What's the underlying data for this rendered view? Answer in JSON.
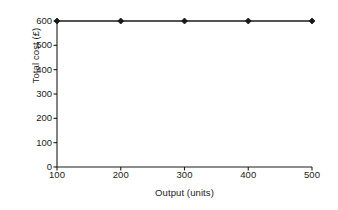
{
  "chart_data": {
    "type": "line",
    "title": "",
    "xlabel": "Output (units)",
    "ylabel": "Total cost (£)",
    "x": [
      100,
      200,
      300,
      400,
      500
    ],
    "values": [
      600,
      600,
      600,
      600,
      600
    ],
    "series": [
      {
        "name": "Total cost",
        "values": [
          600,
          600,
          600,
          600,
          600
        ]
      }
    ],
    "xtick_labels": [
      "100",
      "200",
      "300",
      "400",
      "500"
    ],
    "ytick_labels": [
      "0",
      "100",
      "200",
      "300",
      "400",
      "500",
      "600"
    ],
    "xticks": [
      100,
      200,
      300,
      400,
      500
    ],
    "yticks": [
      0,
      100,
      200,
      300,
      400,
      500,
      600
    ],
    "xlim": [
      100,
      500
    ],
    "ylim": [
      0,
      600
    ],
    "grid": false,
    "legend": false,
    "legend_position": "none",
    "marker": "diamond",
    "line_color": "#1a1a1a",
    "marker_color": "#1a1a1a",
    "background_color": "#ffffff",
    "axis_color": "#1a1a1a"
  }
}
